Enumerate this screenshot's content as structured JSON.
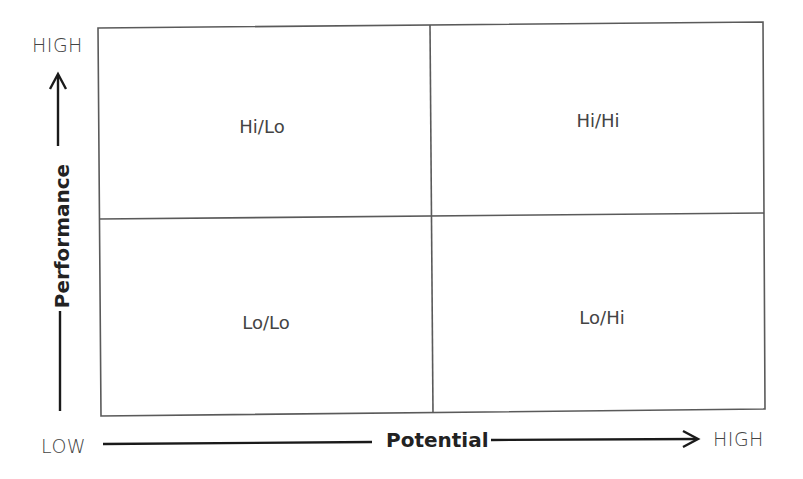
{
  "diagram": {
    "type": "2x2 matrix",
    "y_axis": {
      "title": "Performance",
      "high_label": "HIGH",
      "low_label": "LOW"
    },
    "x_axis": {
      "title": "Potential",
      "low_label": "LOW",
      "high_label": "HIGH"
    },
    "quadrants": {
      "top_left": "Hi/Lo",
      "top_right": "Hi/Hi",
      "bottom_left": "Lo/Lo",
      "bottom_right": "Lo/Hi"
    },
    "colors": {
      "grid_line": "#555555",
      "axis_line": "#1a1a1a",
      "text": "#444444",
      "background": "#ffffff"
    }
  }
}
